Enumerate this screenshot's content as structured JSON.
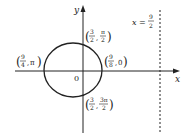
{
  "diagram": {
    "axes": {
      "x_label": "x",
      "y_label": "y",
      "origin_label": "0"
    },
    "directrix": {
      "lhs": "x =",
      "num": "9",
      "den": "2"
    },
    "points": {
      "top": {
        "a_num": "3",
        "a_den": "2",
        "b_num": "π",
        "b_den": "2"
      },
      "right": {
        "a_num": "9",
        "a_den": "8",
        "b": "0"
      },
      "left": {
        "a_num": "9",
        "a_den": "4",
        "b": "π"
      },
      "bottom": {
        "a_num": "3",
        "a_den": "2",
        "b_num": "3π",
        "b_den": "2"
      }
    },
    "colors": {
      "stroke": "#222222",
      "background": "#ffffff"
    }
  }
}
